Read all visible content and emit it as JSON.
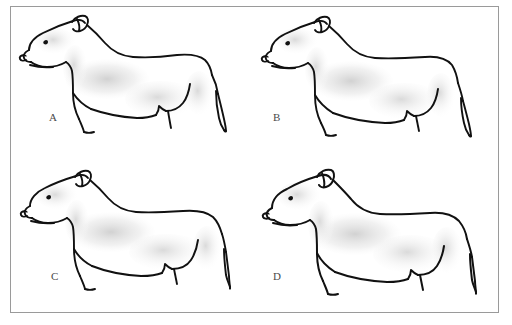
{
  "plate": {
    "title": "Dog conformation comparison plate",
    "description": "Four line drawings of a bull-terrier-type dog in left profile, arranged in a two-by-two grid inside a thin rectangular border.",
    "border_color": "#9a9a9a",
    "background_color": "#ffffff",
    "ink_color": "#111111",
    "shade_color": "#d9d9d9",
    "layout": {
      "columns": 2,
      "rows": 2
    },
    "panels": [
      {
        "id": "A",
        "label": "A",
        "subject": "dog-profile-drawing",
        "orientation": "facing-left",
        "build": "moderate, level topline, slightly tucked loin",
        "position": "top-left"
      },
      {
        "id": "B",
        "label": "B",
        "subject": "dog-profile-drawing",
        "orientation": "facing-left",
        "build": "shorter legs, longer lower body line",
        "position": "top-right"
      },
      {
        "id": "C",
        "label": "C",
        "subject": "dog-profile-drawing",
        "orientation": "facing-left",
        "build": "longer back, sloping croup, lower tail set",
        "position": "bottom-left"
      },
      {
        "id": "D",
        "label": "D",
        "subject": "dog-profile-drawing",
        "orientation": "facing-left",
        "build": "heaviest, deepest chest, broadest head",
        "position": "bottom-right"
      }
    ]
  }
}
